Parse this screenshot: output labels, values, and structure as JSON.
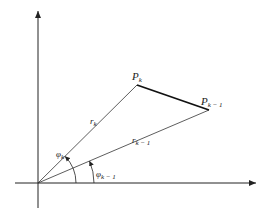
{
  "diagram": {
    "type": "polar-coordinates-sketch",
    "points": {
      "p_k": {
        "label": "P",
        "sub": "k"
      },
      "p_k_minus_1": {
        "label": "P",
        "sub": "k − 1"
      }
    },
    "radii": {
      "r_k": {
        "label": "r",
        "sub": "k"
      },
      "r_k_minus_1": {
        "label": "r",
        "sub": "k − 1"
      }
    },
    "angles": {
      "phi_k": {
        "label": "φ",
        "sub": "k"
      },
      "phi_k_minus_1": {
        "label": "φ",
        "sub": "k − 1"
      }
    },
    "colors": {
      "ink": "#222222",
      "background": "#ffffff"
    }
  }
}
